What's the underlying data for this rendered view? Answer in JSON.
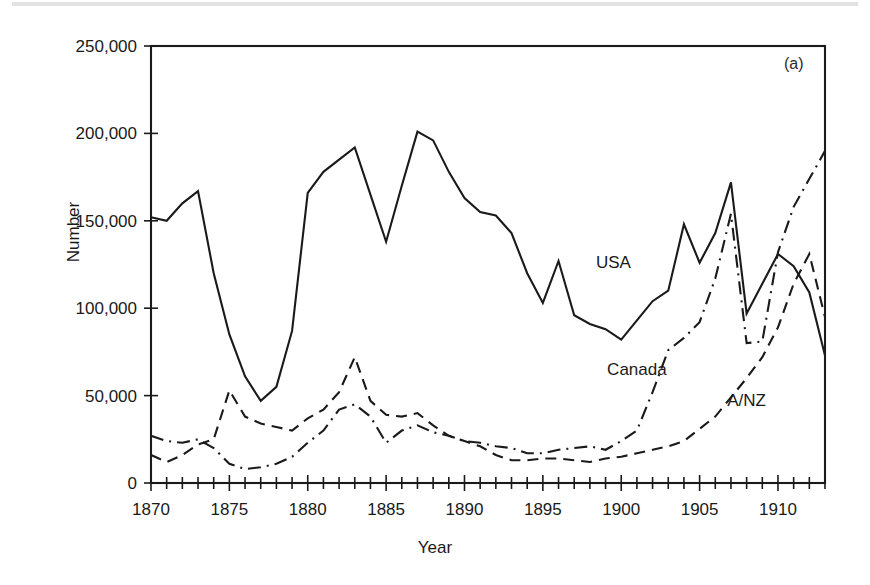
{
  "figure": {
    "panel_label": "(a)",
    "xlabel": "Year",
    "ylabel": "Number"
  },
  "chart_data": {
    "type": "line",
    "title": "",
    "subtitle": "",
    "xlabel": "Year",
    "ylabel": "Number",
    "xlim": [
      1870,
      1913
    ],
    "ylim": [
      0,
      250000
    ],
    "xticks_major": [
      1870,
      1875,
      1880,
      1885,
      1890,
      1895,
      1900,
      1905,
      1910
    ],
    "xtick_labels": [
      "1870",
      "1875",
      "1880",
      "1885",
      "1890",
      "1895",
      "1900",
      "1905",
      "1910"
    ],
    "xtick_minor_step": 1,
    "yticks": [
      0,
      50000,
      100000,
      150000,
      200000,
      250000
    ],
    "ytick_labels": [
      "0",
      "50,000",
      "100,000",
      "150,000",
      "200,000",
      "250,000"
    ],
    "grid": false,
    "legend_position": "inline-annotations",
    "annotations": [
      {
        "text": "USA",
        "x": 1899.5,
        "y": 123000
      },
      {
        "text": "Canada",
        "x": 1901.0,
        "y": 62000
      },
      {
        "text": "A/NZ",
        "x": 1908.0,
        "y": 44000
      },
      {
        "text": "(a)",
        "x": 1911.0,
        "y": 237000
      }
    ],
    "x": [
      1870,
      1871,
      1872,
      1873,
      1874,
      1875,
      1876,
      1877,
      1878,
      1879,
      1880,
      1881,
      1882,
      1883,
      1884,
      1885,
      1886,
      1887,
      1888,
      1889,
      1890,
      1891,
      1892,
      1893,
      1894,
      1895,
      1896,
      1897,
      1898,
      1899,
      1900,
      1901,
      1902,
      1903,
      1904,
      1905,
      1906,
      1907,
      1908,
      1909,
      1910,
      1911,
      1912,
      1913
    ],
    "series": [
      {
        "name": "USA",
        "linestyle": "solid",
        "values": [
          152000,
          150000,
          160000,
          167000,
          120000,
          85000,
          61000,
          47000,
          55000,
          87000,
          166000,
          178000,
          185000,
          192000,
          165000,
          138000,
          170000,
          201000,
          196000,
          178000,
          163000,
          155000,
          153000,
          143000,
          120000,
          103000,
          127000,
          96000,
          91000,
          88000,
          82000,
          93000,
          104000,
          110000,
          148000,
          126000,
          143000,
          172000,
          97000,
          114000,
          131000,
          124000,
          109000,
          73000
        ]
      },
      {
        "name": "Canada",
        "linestyle": "dashdot",
        "values": [
          27000,
          24000,
          23000,
          25000,
          20000,
          11000,
          8000,
          9000,
          11000,
          15000,
          23000,
          30000,
          42000,
          45000,
          38000,
          23000,
          30000,
          33000,
          29000,
          27000,
          24000,
          23000,
          21000,
          20000,
          17000,
          17000,
          19000,
          20000,
          21000,
          19000,
          24000,
          30000,
          52000,
          76000,
          83000,
          92000,
          117000,
          154000,
          80000,
          81000,
          132000,
          158000,
          174000,
          190000
        ]
      },
      {
        "name": "A/NZ",
        "linestyle": "solid",
        "values": [
          16000,
          12000,
          16000,
          22000,
          25000,
          53000,
          38000,
          34000,
          32000,
          30000,
          37000,
          42000,
          52000,
          72000,
          47000,
          39000,
          38000,
          40000,
          33000,
          27000,
          24000,
          21000,
          16000,
          13000,
          13000,
          14000,
          14000,
          13000,
          12000,
          14000,
          15000,
          17000,
          19000,
          21000,
          24000,
          31000,
          38000,
          49000,
          60000,
          72000,
          89000,
          114000,
          131000,
          95000
        ]
      }
    ]
  }
}
